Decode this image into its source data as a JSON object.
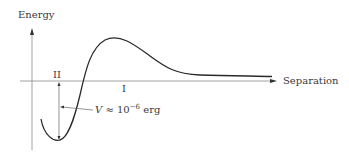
{
  "diagram": {
    "axes": {
      "y_label": "Energy",
      "x_label": "Separation"
    },
    "regions": {
      "region_one": "I",
      "region_two": "II"
    },
    "annotation": {
      "symbol": "V",
      "relation": "≈ 10",
      "exponent": "−6",
      "unit": "erg"
    },
    "colors": {
      "curve": "#2a2a2a",
      "axis": "#7a7a7a",
      "text": "#3a3a3a"
    }
  }
}
